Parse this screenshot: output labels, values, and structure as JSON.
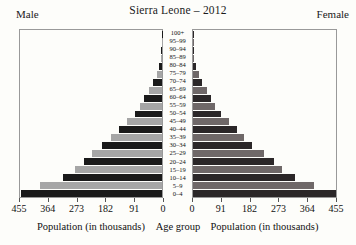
{
  "figure": {
    "title": "Sierra Leone – 2012",
    "left_side_label": "Male",
    "right_side_label": "Female",
    "left_axis_caption": "Population (in thousands)",
    "center_axis_caption": "Age group",
    "right_axis_caption": "Population (in thousands)"
  },
  "colors": {
    "male_bar_dark": "#1a1a1a",
    "male_bar_light": "#a6a6a6",
    "female_bar_dark": "#2b2728",
    "female_bar_light": "#6f6868",
    "panel_border": "#999999",
    "background": "#fdfdfa"
  },
  "chart_data": {
    "type": "bar",
    "subtype": "population-pyramid",
    "title": "Sierra Leone – 2012",
    "units": "thousands",
    "xlim": [
      0,
      455
    ],
    "x_ticks_left": [
      "455",
      "364",
      "273",
      "182",
      "91",
      "0"
    ],
    "x_ticks_right": [
      "0",
      "91",
      "182",
      "273",
      "364",
      "455"
    ],
    "categories": [
      "100+",
      "95–99",
      "90–94",
      "85–89",
      "80–84",
      "75–79",
      "70–74",
      "65–69",
      "60–64",
      "55–59",
      "50–54",
      "45–49",
      "40–44",
      "35–39",
      "30–34",
      "25–29",
      "20–24",
      "15–19",
      "10–14",
      "5–9",
      "0–4"
    ],
    "series": [
      {
        "name": "Male",
        "values": [
          1,
          1,
          2,
          4,
          9,
          17,
          28,
          43,
          57,
          70,
          88,
          112,
          138,
          163,
          192,
          224,
          251,
          279,
          317,
          391,
          452
        ]
      },
      {
        "name": "Female",
        "values": [
          1,
          1,
          2,
          4,
          10,
          19,
          30,
          46,
          58,
          71,
          89,
          113,
          140,
          161,
          188,
          227,
          258,
          283,
          323,
          386,
          454
        ]
      }
    ],
    "legend": null,
    "grid": false
  }
}
